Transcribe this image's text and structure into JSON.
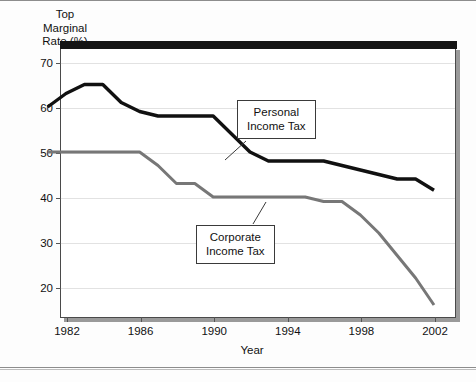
{
  "chart_data": {
    "type": "line",
    "title": "",
    "xlabel": "Year",
    "ylabel": "Top Marginal Rate (%)",
    "ylabel_lines": [
      "Top",
      "Marginal",
      "Rate (%)"
    ],
    "xlim": [
      1981,
      2002
    ],
    "ylim": [
      14,
      72
    ],
    "grid": true,
    "grid_axis": "y",
    "legend_position": "inline-callout-boxes",
    "yticks": [
      20,
      30,
      40,
      50,
      60,
      70
    ],
    "ytick_labels": [
      "20",
      "30",
      "40",
      "50",
      "60",
      "70"
    ],
    "xticks": [
      1982,
      1986,
      1990,
      1994,
      1998,
      2002
    ],
    "xtick_labels": [
      "1982",
      "1986",
      "1990",
      "1994",
      "1998",
      "2002"
    ],
    "x": [
      1981,
      1982,
      1983,
      1984,
      1985,
      1986,
      1987,
      1988,
      1989,
      1990,
      1991,
      1992,
      1993,
      1994,
      1995,
      1996,
      1997,
      1998,
      1999,
      2000,
      2001,
      2002
    ],
    "series": [
      {
        "name": "Personal Income Tax",
        "color": "#111111",
        "width": 3.4,
        "values": [
          60,
          63,
          65,
          65,
          61,
          59,
          58,
          58,
          58,
          58,
          54,
          50,
          48,
          48,
          48,
          48,
          47,
          46,
          45,
          44,
          44,
          41.5
        ]
      },
      {
        "name": "Corporate Income Tax",
        "color": "#777777",
        "width": 3.0,
        "values": [
          50,
          50,
          50,
          50,
          50,
          50,
          47,
          43,
          43,
          40,
          40,
          40,
          40,
          40,
          40,
          39,
          39,
          36,
          32,
          27,
          22,
          16
        ]
      }
    ],
    "annotations": [
      {
        "id": "callout-personal",
        "lines": [
          "Personal",
          "Income Tax"
        ],
        "points_to_series": "Personal Income Tax",
        "points_to_year": 1992
      },
      {
        "id": "callout-corporate",
        "lines": [
          "Corporate",
          "Income Tax"
        ],
        "points_to_series": "Corporate Income Tax",
        "points_to_year": 1993
      }
    ]
  }
}
